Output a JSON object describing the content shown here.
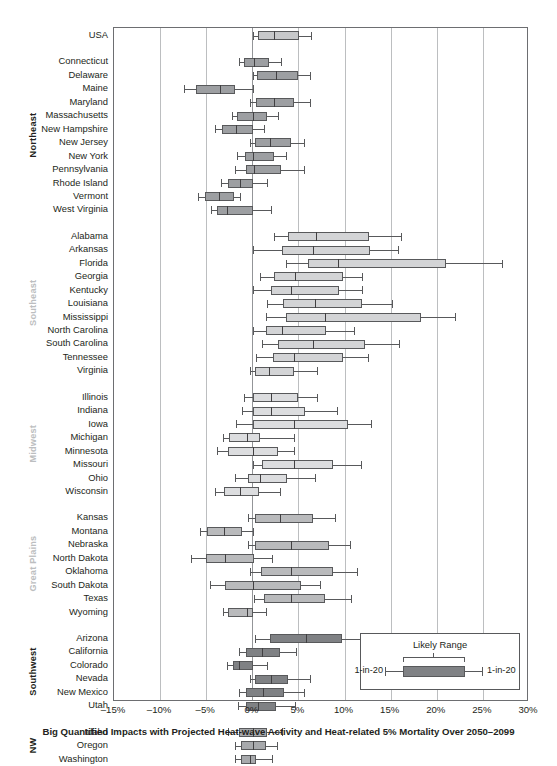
{
  "chart_data": {
    "type": "box",
    "title": "",
    "caption": "Big Quantified Impacts with Projected Heat-wave Activity and Heat-related 5% Mortality Over 2050–2099",
    "xlabel": "",
    "ylabel": "",
    "xlim": [
      -15,
      30
    ],
    "xticks": [
      -15,
      -10,
      -5,
      0,
      5,
      10,
      15,
      20,
      25,
      30
    ],
    "xticklabels": [
      "–15%",
      "–10%",
      "–5%",
      "0%",
      "5%",
      "10%",
      "15%",
      "20%",
      "25%",
      "30%"
    ],
    "grid": true,
    "legend": {
      "position": "inside-bottom-right",
      "title": "Likely Range",
      "left_label": "1-in-20",
      "right_label": "1-in-20"
    },
    "colors": {
      "northeast_box": "#9d9fa2",
      "southeast_box": "#d3d4d6",
      "midwest_box": "#dcdddf",
      "greatplains_box": "#b9babc",
      "southwest_box": "#7f8184",
      "nw_box": "#a7a9ac",
      "usa_box": "#c7c8ca",
      "whisker": "#58595b",
      "gridline": "#bcbec0",
      "zero_gridline": "#939598",
      "frame": "#6d6e71"
    },
    "regions": [
      {
        "name": "",
        "label_color": "#231f20",
        "box_fill": "#c7c8ca",
        "series": [
          {
            "label": "USA",
            "whisker_low": 0.1,
            "q1": 0.6,
            "median": 2.4,
            "q3": 5.1,
            "whisker_high": 6.4
          }
        ]
      },
      {
        "name": "Northeast",
        "label_color": "#231f20",
        "box_fill": "#9d9fa2",
        "series": [
          {
            "label": "Connecticut",
            "whisker_low": -1.4,
            "q1": -0.9,
            "median": 0.2,
            "q3": 1.8,
            "whisker_high": 3.1
          },
          {
            "label": "Delaware",
            "whisker_low": 0.1,
            "q1": 0.5,
            "median": 2.6,
            "q3": 4.9,
            "whisker_high": 6.3
          },
          {
            "label": "Maine",
            "whisker_low": -7.4,
            "q1": -6.1,
            "median": -3.5,
            "q3": -1.9,
            "whisker_high": 0.1
          },
          {
            "label": "Maryland",
            "whisker_low": -0.2,
            "q1": 0.4,
            "median": 2.4,
            "q3": 4.5,
            "whisker_high": 6.2
          },
          {
            "label": "Massachusetts",
            "whisker_low": -2.2,
            "q1": -1.7,
            "median": 0.1,
            "q3": 1.6,
            "whisker_high": 2.8
          },
          {
            "label": "New Hampshire",
            "whisker_low": -4.0,
            "q1": -3.3,
            "median": -1.8,
            "q3": 0.1,
            "whisker_high": 1.3
          },
          {
            "label": "New Jersey",
            "whisker_low": -0.2,
            "q1": 0.3,
            "median": 1.9,
            "q3": 4.2,
            "whisker_high": 5.6
          },
          {
            "label": "New York",
            "whisker_low": -1.7,
            "q1": -0.8,
            "median": 0.1,
            "q3": 2.4,
            "whisker_high": 3.6
          },
          {
            "label": "Pennsylvania",
            "whisker_low": -1.9,
            "q1": -0.7,
            "median": 0.2,
            "q3": 3.1,
            "whisker_high": 5.6
          },
          {
            "label": "Rhode Island",
            "whisker_low": -3.4,
            "q1": -2.6,
            "median": -1.3,
            "q3": 0.1,
            "whisker_high": 1.6
          },
          {
            "label": "Vermont",
            "whisker_low": -5.9,
            "q1": -5.1,
            "median": -3.6,
            "q3": -2.0,
            "whisker_high": -1.3
          },
          {
            "label": "West Virginia",
            "whisker_low": -4.5,
            "q1": -3.8,
            "median": -2.8,
            "q3": 0.1,
            "whisker_high": 2.0
          }
        ]
      },
      {
        "name": "Southeast",
        "label_color": "#bcbec0",
        "box_fill": "#d3d4d6",
        "series": [
          {
            "label": "Alabama",
            "whisker_low": 2.3,
            "q1": 3.9,
            "median": 6.9,
            "q3": 12.7,
            "whisker_high": 16.1
          },
          {
            "label": "Arkansas",
            "whisker_low": 0.1,
            "q1": 3.2,
            "median": 6.6,
            "q3": 12.8,
            "whisker_high": 15.8
          },
          {
            "label": "Florida",
            "whisker_low": 3.6,
            "q1": 6.0,
            "median": 9.3,
            "q3": 21.0,
            "whisker_high": 27.1
          },
          {
            "label": "Georgia",
            "whisker_low": 0.8,
            "q1": 2.4,
            "median": 4.6,
            "q3": 9.8,
            "whisker_high": 11.9
          },
          {
            "label": "Kentucky",
            "whisker_low": 0.1,
            "q1": 2.0,
            "median": 4.2,
            "q3": 9.4,
            "whisker_high": 11.9
          },
          {
            "label": "Louisiana",
            "whisker_low": 1.6,
            "q1": 3.3,
            "median": 6.8,
            "q3": 11.9,
            "whisker_high": 15.1
          },
          {
            "label": "Mississippi",
            "whisker_low": 1.5,
            "q1": 3.7,
            "median": 7.9,
            "q3": 18.3,
            "whisker_high": 22.0
          },
          {
            "label": "North Carolina",
            "whisker_low": 0.1,
            "q1": 1.5,
            "median": 3.2,
            "q3": 8.0,
            "whisker_high": 11.0
          },
          {
            "label": "South Carolina",
            "whisker_low": 1.0,
            "q1": 2.8,
            "median": 6.6,
            "q3": 12.2,
            "whisker_high": 15.9
          },
          {
            "label": "Tennessee",
            "whisker_low": 0.4,
            "q1": 2.2,
            "median": 4.5,
            "q3": 9.8,
            "whisker_high": 12.5
          },
          {
            "label": "Virginia",
            "whisker_low": -0.2,
            "q1": 0.3,
            "median": 1.8,
            "q3": 4.5,
            "whisker_high": 7.0
          }
        ]
      },
      {
        "name": "Midwest",
        "label_color": "#bcbec0",
        "box_fill": "#dcdddf",
        "series": [
          {
            "label": "Illinois",
            "whisker_low": -0.9,
            "q1": 0.1,
            "median": 2.0,
            "q3": 5.0,
            "whisker_high": 7.0
          },
          {
            "label": "Indiana",
            "whisker_low": -1.1,
            "q1": 0.1,
            "median": 2.0,
            "q3": 5.7,
            "whisker_high": 9.2
          },
          {
            "label": "Iowa",
            "whisker_low": -1.8,
            "q1": 0.1,
            "median": 4.5,
            "q3": 10.4,
            "whisker_high": 12.9
          },
          {
            "label": "Michigan",
            "whisker_low": -3.2,
            "q1": -2.5,
            "median": -0.6,
            "q3": 0.8,
            "whisker_high": 4.5
          },
          {
            "label": "Minnesota",
            "whisker_low": -3.8,
            "q1": -2.6,
            "median": 0.1,
            "q3": 2.8,
            "whisker_high": 4.5
          },
          {
            "label": "Missouri",
            "whisker_low": 0.1,
            "q1": 1.0,
            "median": 4.5,
            "q3": 8.8,
            "whisker_high": 11.8
          },
          {
            "label": "Ohio",
            "whisker_low": -1.9,
            "q1": -0.5,
            "median": 0.8,
            "q3": 3.8,
            "whisker_high": 6.8
          },
          {
            "label": "Wisconsin",
            "whisker_low": -4.0,
            "q1": -3.1,
            "median": -1.3,
            "q3": 0.7,
            "whisker_high": 3.0
          }
        ]
      },
      {
        "name": "Great Plains",
        "label_color": "#bcbec0",
        "box_fill": "#b9babc",
        "series": [
          {
            "label": "Kansas",
            "whisker_low": -0.5,
            "q1": 0.3,
            "median": 3.0,
            "q3": 6.6,
            "whisker_high": 9.0
          },
          {
            "label": "Montana",
            "whisker_low": -5.7,
            "q1": -4.9,
            "median": -3.1,
            "q3": -1.1,
            "whisker_high": 0.1
          },
          {
            "label": "Nebraska",
            "whisker_low": -0.5,
            "q1": 0.3,
            "median": 4.2,
            "q3": 8.3,
            "whisker_high": 10.6
          },
          {
            "label": "North Dakota",
            "whisker_low": -6.7,
            "q1": -5.0,
            "median": -3.0,
            "q3": 0.2,
            "whisker_high": 2.1
          },
          {
            "label": "Oklahoma",
            "whisker_low": -0.2,
            "q1": 0.9,
            "median": 4.2,
            "q3": 8.7,
            "whisker_high": 11.4
          },
          {
            "label": "South Dakota",
            "whisker_low": -4.6,
            "q1": -3.0,
            "median": 0.1,
            "q3": 5.3,
            "whisker_high": 7.3
          },
          {
            "label": "Texas",
            "whisker_low": 0.2,
            "q1": 1.3,
            "median": 4.2,
            "q3": 7.9,
            "whisker_high": 10.7
          },
          {
            "label": "Wyoming",
            "whisker_low": -3.2,
            "q1": -2.6,
            "median": -0.6,
            "q3": 0.1,
            "whisker_high": 1.5
          }
        ]
      },
      {
        "name": "Southwest",
        "label_color": "#231f20",
        "box_fill": "#7f8184",
        "series": [
          {
            "label": "Arizona",
            "whisker_low": 0.3,
            "q1": 1.9,
            "median": 5.8,
            "q3": 9.7,
            "whisker_high": 12.8
          },
          {
            "label": "California",
            "whisker_low": -1.4,
            "q1": -0.7,
            "median": 1.1,
            "q3": 3.0,
            "whisker_high": 4.7
          },
          {
            "label": "Colorado",
            "whisker_low": -2.8,
            "q1": -2.1,
            "median": -1.4,
            "q3": 0.1,
            "whisker_high": 1.6
          },
          {
            "label": "Nevada",
            "whisker_low": -0.3,
            "q1": 0.3,
            "median": 2.0,
            "q3": 3.9,
            "whisker_high": 6.3
          },
          {
            "label": "New Mexico",
            "whisker_low": -1.5,
            "q1": -0.7,
            "median": 1.2,
            "q3": 3.4,
            "whisker_high": 5.6
          },
          {
            "label": "Utah",
            "whisker_low": -1.6,
            "q1": -0.7,
            "median": 0.6,
            "q3": 2.6,
            "whisker_high": 4.6
          }
        ]
      },
      {
        "name": "NW",
        "label_color": "#231f20",
        "box_fill": "#a7a9ac",
        "series": [
          {
            "label": "Idaho",
            "whisker_low": -2.6,
            "q1": -1.5,
            "median": 0.1,
            "q3": 1.6,
            "whisker_high": 3.2
          },
          {
            "label": "Oregon",
            "whisker_low": -1.9,
            "q1": -1.2,
            "median": 0.1,
            "q3": 1.5,
            "whisker_high": 2.7
          },
          {
            "label": "Washington",
            "whisker_low": -1.9,
            "q1": -1.2,
            "median": -0.3,
            "q3": 0.4,
            "whisker_high": 2.1
          }
        ]
      }
    ]
  }
}
